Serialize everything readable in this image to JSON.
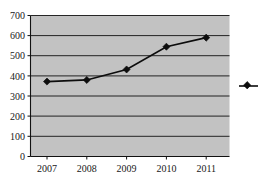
{
  "chart_data": {
    "type": "line",
    "title": "",
    "subtitle": "",
    "xlabel": "",
    "ylabel": "",
    "categories": [
      "2007",
      "2008",
      "2009",
      "2010",
      "2011"
    ],
    "series": [
      {
        "name": "Series 1",
        "values": [
          372,
          380,
          432,
          545,
          590
        ],
        "color": "#0d0d0d",
        "marker": "diamond"
      }
    ],
    "ylim": [
      0,
      700
    ],
    "yticks": [
      0,
      100,
      200,
      300,
      400,
      500,
      600,
      700
    ],
    "ytick_labels": [
      "0",
      "100",
      "200",
      "300",
      "400",
      "500",
      "600",
      "700"
    ],
    "xtick_labels": [
      "2007",
      "2008",
      "2009",
      "2010",
      "2011"
    ],
    "grid": {
      "horizontal": true,
      "vertical": false,
      "color": "#111111"
    },
    "plot_background": "#c2c2c2",
    "page_background": "#ffffff",
    "legend": {
      "visible": true,
      "position": "right",
      "clipped": true,
      "entries": [
        {
          "label": "",
          "color": "#0d0d0d",
          "marker": "diamond"
        }
      ]
    }
  },
  "axis": {
    "y": {
      "t700": "700",
      "t600": "600",
      "t500": "500",
      "t400": "400",
      "t300": "300",
      "t200": "200",
      "t100": "100",
      "t0": "0"
    },
    "x": {
      "t2007": "2007",
      "t2008": "2008",
      "t2009": "2009",
      "t2010": "2010",
      "t2011": "2011"
    }
  }
}
